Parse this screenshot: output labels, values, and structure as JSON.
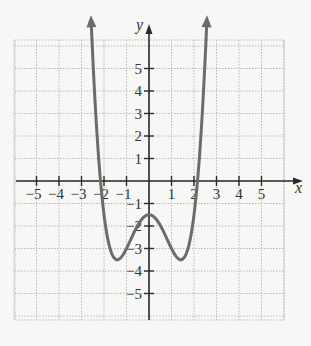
{
  "chart_data": {
    "type": "line",
    "title": "",
    "xlabel": "x",
    "ylabel": "y",
    "xlim": [
      -6,
      6
    ],
    "ylim": [
      -6,
      6
    ],
    "grid": true,
    "x_ticks": [
      -5,
      -4,
      -3,
      -2,
      -1,
      1,
      2,
      3,
      4,
      5
    ],
    "y_ticks": [
      5,
      4,
      3,
      2,
      1,
      -1,
      -2,
      -3,
      -4,
      -5
    ],
    "x_tick_labels": [
      "−5",
      "−4",
      "−3",
      "−2",
      "−1",
      "1",
      "2",
      "3",
      "4",
      "5"
    ],
    "y_tick_labels": [
      "5",
      "4",
      "3",
      "2",
      "1",
      "−1",
      "−2",
      "−3",
      "−4",
      "−5"
    ],
    "series": [
      {
        "name": "f(x)",
        "description": "W-shaped quartic, arrows at both ends pointing up",
        "key_points": [
          {
            "x": -2.6,
            "y": 5.7,
            "note": "arrow end"
          },
          {
            "x": -2.1,
            "y": 0,
            "note": "x-intercept"
          },
          {
            "x": -1.4,
            "y": -3.5,
            "note": "local minimum"
          },
          {
            "x": 0,
            "y": -1.5,
            "note": "local maximum / y-intercept"
          },
          {
            "x": 1.4,
            "y": -3.5,
            "note": "local minimum"
          },
          {
            "x": 2.1,
            "y": 0,
            "note": "x-intercept"
          },
          {
            "x": 2.6,
            "y": 5.7,
            "note": "arrow end"
          }
        ],
        "color": "#6b6b6b"
      }
    ],
    "colors": {
      "curve": "#6b6b6b",
      "axes": "#2a2a2a",
      "grid": "#b8b8b8",
      "background": "#f7f7f5"
    }
  },
  "labels": {
    "x_axis": "x",
    "y_axis": "y"
  }
}
